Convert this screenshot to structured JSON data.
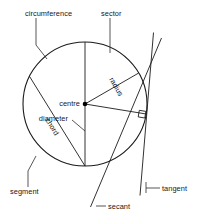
{
  "diagram": {
    "colors": {
      "sector_fill": "#d8d8d8",
      "segment_fill": "#9b9b9b",
      "stroke": "#1b1b1b",
      "background": "#ffffff",
      "text": "#171717"
    },
    "geometry": {
      "centre_x": 85,
      "centre_y": 104,
      "radius": 62
    },
    "labels": {
      "circumference": "circumference",
      "sector": "sector",
      "centre": "centre",
      "diameter": "diameter",
      "radius": "radius",
      "chord": "chord",
      "segment": "segment",
      "secant": "secant",
      "tangent": "tangent"
    }
  }
}
